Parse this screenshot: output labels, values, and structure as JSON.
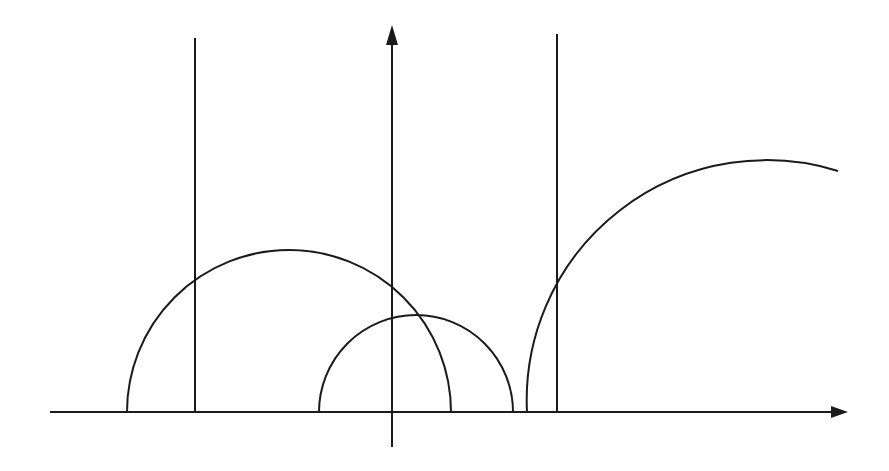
{
  "diagram": {
    "stroke_color": "#1a1a1a",
    "background": "#ffffff",
    "x_axis": {
      "x1": 50,
      "y": 412,
      "x2": 834,
      "arrow_tip": 848
    },
    "y_axis": {
      "x": 392,
      "y_bottom": 447,
      "y1": 40,
      "arrow_tip": 25
    },
    "vertical_lines": [
      {
        "x": 195,
        "y_top": 38,
        "y_bottom": 412
      },
      {
        "x": 557,
        "y_top": 34,
        "y_bottom": 412
      }
    ],
    "arcs": [
      {
        "name": "large-semicircle",
        "cx": 289,
        "cy": 412,
        "r": 162
      },
      {
        "name": "small-semicircle",
        "cx": 416,
        "cy": 412,
        "r": 97
      },
      {
        "name": "right-partial-arc",
        "cx": 767,
        "cy": 412,
        "r": 240,
        "end_x": 838,
        "end_y": 171
      }
    ]
  }
}
